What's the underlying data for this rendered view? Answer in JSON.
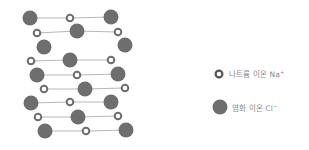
{
  "figure": {
    "colors": {
      "chloride_fill": "#6e6e6e",
      "sodium_ring": "#6e6e6e",
      "sodium_center": "#ffffff",
      "bond_line": "#b8b8b8",
      "label_text": "#8a8a8a"
    },
    "legend": {
      "items": [
        {
          "label": "나트륨 이온 Na",
          "charge": "+",
          "type": "sodium"
        },
        {
          "label": "염화 이온 Cl",
          "charge": "−",
          "type": "chloride"
        }
      ]
    },
    "lattice": {
      "chloride": [
        [
          30,
          18
        ],
        [
          111,
          17
        ],
        [
          77,
          31
        ],
        [
          44,
          47
        ],
        [
          125,
          45
        ],
        [
          70,
          60
        ],
        [
          37,
          75
        ],
        [
          118,
          74
        ],
        [
          85,
          89
        ],
        [
          31,
          103
        ],
        [
          111,
          102
        ],
        [
          78,
          117
        ],
        [
          45,
          131
        ],
        [
          126,
          130
        ]
      ],
      "sodium": [
        [
          70,
          18
        ],
        [
          37,
          33
        ],
        [
          118,
          32
        ],
        [
          31,
          61
        ],
        [
          111,
          60
        ],
        [
          77,
          75
        ],
        [
          44,
          89
        ],
        [
          125,
          88
        ],
        [
          70,
          102
        ],
        [
          38,
          117
        ],
        [
          118,
          116
        ],
        [
          86,
          131
        ]
      ]
    }
  }
}
